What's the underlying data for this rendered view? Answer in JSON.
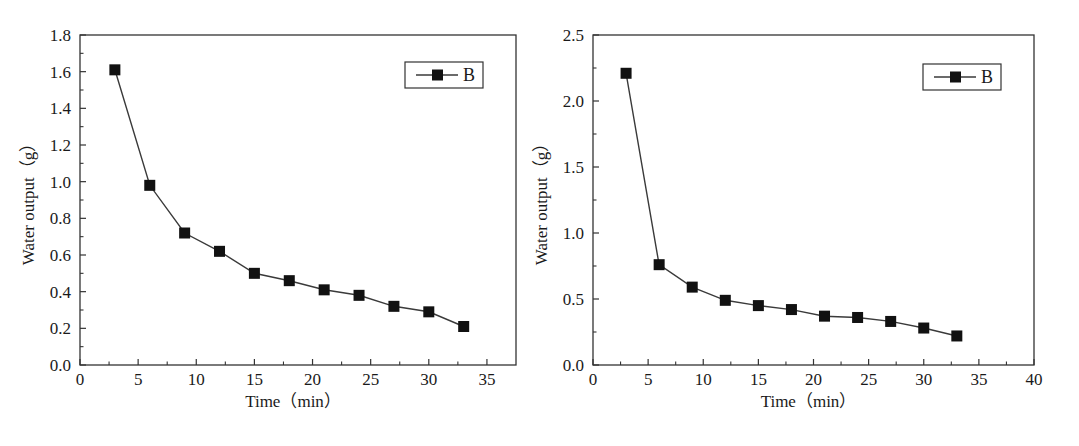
{
  "chart_data": [
    {
      "type": "line",
      "title": "",
      "xlabel": "Time（min）",
      "ylabel": "Water output（g）",
      "xlim": [
        0,
        37.5
      ],
      "ylim": [
        0,
        1.8
      ],
      "xticks": [
        0,
        5,
        10,
        15,
        20,
        25,
        30,
        35
      ],
      "xtick_labels": [
        "0",
        "5",
        "10",
        "15",
        "20",
        "25",
        "30",
        "35"
      ],
      "yticks": [
        0.0,
        0.2,
        0.4,
        0.6,
        0.8,
        1.0,
        1.2,
        1.4,
        1.6,
        1.8
      ],
      "ytick_labels": [
        "0.0",
        "0.2",
        "0.4",
        "0.6",
        "0.8",
        "1.0",
        "1.2",
        "1.4",
        "1.6",
        "1.8"
      ],
      "grid": false,
      "legend_position": "upper right",
      "series": [
        {
          "name": "B",
          "marker": "square",
          "x": [
            3,
            6,
            9,
            12,
            15,
            18,
            21,
            24,
            27,
            30,
            33
          ],
          "values": [
            1.61,
            0.98,
            0.72,
            0.62,
            0.5,
            0.46,
            0.41,
            0.38,
            0.32,
            0.29,
            0.21
          ]
        }
      ]
    },
    {
      "type": "line",
      "title": "",
      "xlabel": "Time（min）",
      "ylabel": "Water output（g）",
      "xlim": [
        0,
        40
      ],
      "ylim": [
        0,
        2.5
      ],
      "xticks": [
        0,
        5,
        10,
        15,
        20,
        25,
        30,
        35,
        40
      ],
      "xtick_labels": [
        "0",
        "5",
        "10",
        "15",
        "20",
        "25",
        "30",
        "35",
        "40"
      ],
      "yticks": [
        0.0,
        0.5,
        1.0,
        1.5,
        2.0,
        2.5
      ],
      "ytick_labels": [
        "0.0",
        "0.5",
        "1.0",
        "1.5",
        "2.0",
        "2.5"
      ],
      "grid": false,
      "legend_position": "upper right",
      "series": [
        {
          "name": "B",
          "marker": "square",
          "x": [
            3,
            6,
            9,
            12,
            15,
            18,
            21,
            24,
            27,
            30,
            33
          ],
          "values": [
            2.21,
            0.76,
            0.59,
            0.49,
            0.45,
            0.42,
            0.37,
            0.36,
            0.33,
            0.28,
            0.22
          ]
        }
      ]
    }
  ],
  "colors": {
    "axis": "#333333",
    "line": "#3a3a3a",
    "marker": "#111111",
    "background": "#ffffff"
  }
}
